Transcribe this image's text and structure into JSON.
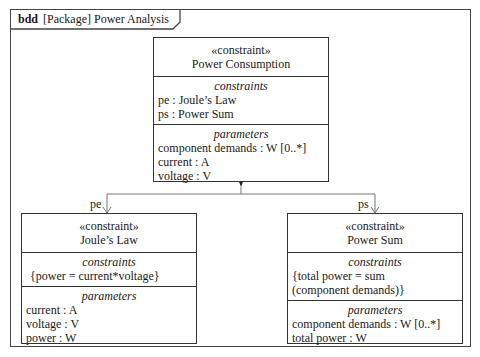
{
  "frame": {
    "kind": "bdd",
    "title": "[Package] Power Analysis"
  },
  "blocks": {
    "power_consumption": {
      "stereotype": "«constraint»",
      "name": "Power Consumption",
      "constraints_title": "constraints",
      "constraints": [
        "pe : Joule’s Law",
        "ps : Power Sum"
      ],
      "parameters_title": "parameters",
      "parameters": [
        "component demands : W [0..*]",
        "current : A",
        "voltage : V"
      ]
    },
    "joules_law": {
      "stereotype": "«constraint»",
      "name": "Joule’s Law",
      "constraints_title": "constraints",
      "constraints": [
        "{power = current*voltage}"
      ],
      "parameters_title": "parameters",
      "parameters": [
        "current : A",
        "voltage : V",
        "power : W"
      ]
    },
    "power_sum": {
      "stereotype": "«constraint»",
      "name": "Power Sum",
      "constraints_title": "constraints",
      "constraints": [
        "{total power = sum",
        "(component demands)}"
      ],
      "parameters_title": "parameters",
      "parameters": [
        "component demands : W [0..*]",
        "total power : W"
      ]
    }
  },
  "associations": {
    "left_role": "pe",
    "right_role": "ps",
    "kind": "composition"
  }
}
